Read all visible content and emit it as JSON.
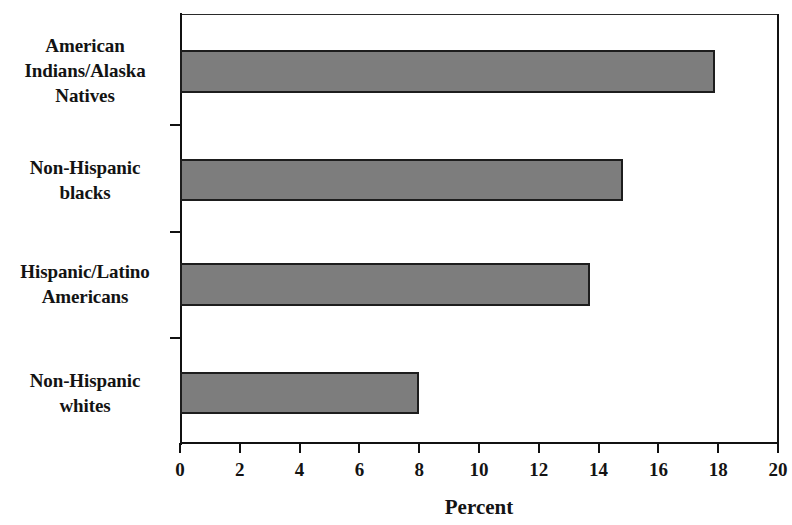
{
  "chart_data": {
    "type": "bar",
    "orientation": "horizontal",
    "title": "",
    "subtitle": "",
    "xlabel": "Percent",
    "ylabel": "",
    "categories": [
      "American Indians/Alaska Natives",
      "Non-Hispanic blacks",
      "Hispanic/Latino Americans",
      "Non-Hispanic whites"
    ],
    "category_lines": [
      [
        "American",
        "Indians/Alaska",
        "Natives"
      ],
      [
        "Non-Hispanic",
        "blacks"
      ],
      [
        "Hispanic/Latino",
        "Americans"
      ],
      [
        "Non-Hispanic",
        "whites"
      ]
    ],
    "values": [
      17.9,
      14.8,
      13.7,
      8.0
    ],
    "series": [
      {
        "name": "Percent",
        "values": [
          17.9,
          14.8,
          13.7,
          8.0
        ]
      }
    ],
    "xlim": [
      0,
      20
    ],
    "xticks": [
      0,
      2,
      4,
      6,
      8,
      10,
      12,
      14,
      16,
      18,
      20
    ],
    "xtick_labels": [
      "0",
      "2",
      "4",
      "6",
      "8",
      "10",
      "12",
      "14",
      "16",
      "18",
      "20"
    ],
    "grid": false,
    "legend": false,
    "legend_position": "none",
    "bar_color": "#7d7d7d",
    "bar_border_color": "#1d1d1d",
    "axis_color": "#111111",
    "background_color": "#ffffff"
  }
}
